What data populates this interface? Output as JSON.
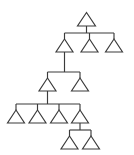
{
  "diagram": {
    "type": "tree",
    "node_shape": "triangle",
    "background_color": "#ffffff",
    "stroke_color": "#3b3b3b",
    "node_fill_color": "#ffffff",
    "stroke_width": 1.15,
    "canvas": {
      "width": 134,
      "height": 155
    },
    "level_count": 5,
    "node_count": 12,
    "edge_count": 11,
    "nodes": [
      {
        "id": "n1",
        "label": "",
        "level": 0,
        "cx": 86.5,
        "base_y": 26.0,
        "half_width": 9.0,
        "height": 13.5
      },
      {
        "id": "n2",
        "label": "",
        "level": 1,
        "cx": 64.5,
        "base_y": 52.0,
        "half_width": 8.5,
        "height": 13.0
      },
      {
        "id": "n3",
        "label": "",
        "level": 1,
        "cx": 89.5,
        "base_y": 52.0,
        "half_width": 8.5,
        "height": 13.0
      },
      {
        "id": "n4",
        "label": "",
        "level": 1,
        "cx": 114.0,
        "base_y": 52.0,
        "half_width": 8.5,
        "height": 13.0
      },
      {
        "id": "n5",
        "label": "",
        "level": 2,
        "cx": 47.5,
        "base_y": 91.0,
        "half_width": 8.5,
        "height": 13.0
      },
      {
        "id": "n6",
        "label": "",
        "level": 2,
        "cx": 80.0,
        "base_y": 91.0,
        "half_width": 8.5,
        "height": 13.0
      },
      {
        "id": "n7",
        "label": "",
        "level": 3,
        "cx": 16.0,
        "base_y": 123.0,
        "half_width": 8.5,
        "height": 13.0
      },
      {
        "id": "n8",
        "label": "",
        "level": 3,
        "cx": 37.5,
        "base_y": 123.0,
        "half_width": 8.5,
        "height": 13.0
      },
      {
        "id": "n9",
        "label": "",
        "level": 3,
        "cx": 59.0,
        "base_y": 123.0,
        "half_width": 8.5,
        "height": 13.0
      },
      {
        "id": "n10",
        "label": "",
        "level": 3,
        "cx": 80.0,
        "base_y": 123.0,
        "half_width": 8.5,
        "height": 13.0
      },
      {
        "id": "n11",
        "label": "",
        "level": 4,
        "cx": 69.5,
        "base_y": 149.0,
        "half_width": 8.5,
        "height": 13.0
      },
      {
        "id": "n12",
        "label": "",
        "level": 4,
        "cx": 91.0,
        "base_y": 149.0,
        "half_width": 8.5,
        "height": 13.0
      }
    ],
    "edges": [
      {
        "id": "e1",
        "from": "n1",
        "to": "n2"
      },
      {
        "id": "e2",
        "from": "n1",
        "to": "n3"
      },
      {
        "id": "e3",
        "from": "n1",
        "to": "n4"
      },
      {
        "id": "e4",
        "from": "n2",
        "to": "n5"
      },
      {
        "id": "e5",
        "from": "n5",
        "to": "n6"
      },
      {
        "id": "e6",
        "from": "n5",
        "to": "n7"
      },
      {
        "id": "e7",
        "from": "n5",
        "to": "n8"
      },
      {
        "id": "e8",
        "from": "n5",
        "to": "n9"
      },
      {
        "id": "e9",
        "from": "n5",
        "to": "n10"
      },
      {
        "id": "e10",
        "from": "n10",
        "to": "n11"
      },
      {
        "id": "e11",
        "from": "n10",
        "to": "n12"
      }
    ],
    "connector_rails": [
      {
        "id": "rail-level-1",
        "y": 33.0,
        "x1": 64.5,
        "x2": 114.0
      },
      {
        "id": "rail-level-2",
        "y": 72.0,
        "x1": 47.5,
        "x2": 80.0
      },
      {
        "id": "rail-level-3",
        "y": 104.0,
        "x1": 16.0,
        "x2": 80.0
      },
      {
        "id": "rail-level-4",
        "y": 130.0,
        "x1": 69.5,
        "x2": 91.0
      }
    ],
    "connector_stems": [
      {
        "id": "stem-root-down",
        "x": 86.5,
        "y1": 26.0,
        "y2": 33.0
      },
      {
        "id": "stem-n2-up",
        "x": 64.5,
        "y1": 33.0,
        "y2": 39.0
      },
      {
        "id": "stem-n3-up",
        "x": 89.5,
        "y1": 33.0,
        "y2": 39.0
      },
      {
        "id": "stem-n4-up",
        "x": 114.0,
        "y1": 33.0,
        "y2": 39.0
      },
      {
        "id": "stem-n2-down",
        "x": 64.5,
        "y1": 52.0,
        "y2": 72.0
      },
      {
        "id": "stem-n5-up",
        "x": 47.5,
        "y1": 72.0,
        "y2": 78.0
      },
      {
        "id": "stem-n6-up",
        "x": 80.0,
        "y1": 72.0,
        "y2": 78.0
      },
      {
        "id": "stem-n5-down",
        "x": 47.5,
        "y1": 91.0,
        "y2": 104.0
      },
      {
        "id": "stem-n7-up",
        "x": 16.0,
        "y1": 104.0,
        "y2": 110.0
      },
      {
        "id": "stem-n8-up",
        "x": 37.5,
        "y1": 104.0,
        "y2": 110.0
      },
      {
        "id": "stem-n9-up",
        "x": 59.0,
        "y1": 104.0,
        "y2": 110.0
      },
      {
        "id": "stem-n10-up",
        "x": 80.0,
        "y1": 104.0,
        "y2": 110.0
      },
      {
        "id": "stem-n10-down",
        "x": 80.0,
        "y1": 123.0,
        "y2": 130.0
      },
      {
        "id": "stem-n11-up",
        "x": 69.5,
        "y1": 130.0,
        "y2": 136.0
      },
      {
        "id": "stem-n12-up",
        "x": 91.0,
        "y1": 130.0,
        "y2": 136.0
      }
    ]
  }
}
